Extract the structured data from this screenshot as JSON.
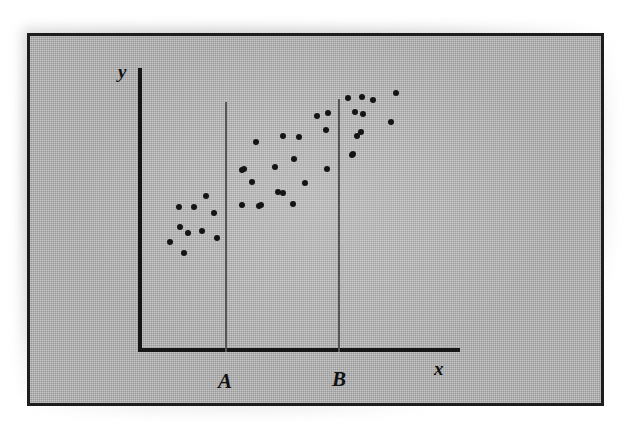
{
  "figure": {
    "kind": "scatter-plot-diagram",
    "frame": {
      "border_color": "#1d1d1d",
      "background_color": "#b3b3b3"
    },
    "axes": {
      "x_label": "x",
      "y_label": "y",
      "axis_color": "#151515"
    },
    "reference_lines": [
      {
        "name": "A",
        "label": "A",
        "x_value": 30,
        "color": "#555555"
      },
      {
        "name": "B",
        "label": "B",
        "x_value": 69,
        "color": "#555555"
      }
    ],
    "dot_color": "#141414"
  },
  "chart_data": {
    "type": "scatter",
    "title": "",
    "xlabel": "x",
    "ylabel": "y",
    "xlim": [
      0,
      100
    ],
    "ylim": [
      0,
      100
    ],
    "grid": false,
    "legend": null,
    "annotations": [
      {
        "text": "A",
        "type": "vertical-reference-line",
        "x": 30
      },
      {
        "text": "B",
        "type": "vertical-reference-line",
        "x": 69
      }
    ],
    "series": [
      {
        "name": "observations",
        "marker": "circle",
        "color": "#141414",
        "points": [
          [
            14,
            48
          ],
          [
            19,
            41
          ],
          [
            22,
            58
          ],
          [
            22,
            57
          ],
          [
            14,
            34
          ],
          [
            20,
            30
          ],
          [
            25,
            51
          ],
          [
            27,
            40
          ],
          [
            17,
            23
          ],
          [
            21,
            18
          ],
          [
            36,
            41
          ],
          [
            40,
            55
          ],
          [
            37,
            33
          ],
          [
            43,
            30
          ],
          [
            46,
            63
          ],
          [
            48,
            48
          ],
          [
            44,
            44
          ],
          [
            52,
            47
          ],
          [
            52,
            68
          ],
          [
            57,
            68
          ],
          [
            56,
            54
          ],
          [
            60,
            41
          ],
          [
            51,
            30
          ],
          [
            46,
            30
          ],
          [
            38,
            30
          ],
          [
            64,
            50
          ],
          [
            66,
            78
          ],
          [
            68,
            62
          ],
          [
            72,
            86
          ],
          [
            75,
            86
          ],
          [
            79,
            85
          ],
          [
            86,
            88
          ],
          [
            74,
            77
          ],
          [
            77,
            76
          ],
          [
            76,
            66
          ],
          [
            75,
            63
          ],
          [
            74,
            51
          ],
          [
            85,
            72
          ],
          [
            88,
            74
          ],
          [
            80,
            41
          ]
        ]
      }
    ]
  },
  "rendered_dots": [
    {
      "x": 170,
      "y": 242
    },
    {
      "x": 179,
      "y": 207
    },
    {
      "x": 180,
      "y": 227
    },
    {
      "x": 184,
      "y": 253
    },
    {
      "x": 188,
      "y": 233
    },
    {
      "x": 194,
      "y": 207
    },
    {
      "x": 202,
      "y": 231
    },
    {
      "x": 206,
      "y": 196
    },
    {
      "x": 214,
      "y": 213
    },
    {
      "x": 217,
      "y": 238
    },
    {
      "x": 242,
      "y": 170
    },
    {
      "x": 242,
      "y": 205
    },
    {
      "x": 244,
      "y": 169
    },
    {
      "x": 252,
      "y": 182
    },
    {
      "x": 256,
      "y": 142
    },
    {
      "x": 259,
      "y": 206
    },
    {
      "x": 261,
      "y": 205
    },
    {
      "x": 275,
      "y": 167
    },
    {
      "x": 278,
      "y": 192
    },
    {
      "x": 283,
      "y": 136
    },
    {
      "x": 293,
      "y": 204
    },
    {
      "x": 294,
      "y": 159
    },
    {
      "x": 299,
      "y": 137
    },
    {
      "x": 305,
      "y": 183
    },
    {
      "x": 317,
      "y": 116
    },
    {
      "x": 326,
      "y": 130
    },
    {
      "x": 327,
      "y": 169
    },
    {
      "x": 328,
      "y": 113
    },
    {
      "x": 348,
      "y": 98
    },
    {
      "x": 352,
      "y": 155
    },
    {
      "x": 353,
      "y": 154
    },
    {
      "x": 355,
      "y": 112
    },
    {
      "x": 357,
      "y": 136
    },
    {
      "x": 361,
      "y": 132
    },
    {
      "x": 362,
      "y": 97
    },
    {
      "x": 363,
      "y": 114
    },
    {
      "x": 373,
      "y": 100
    },
    {
      "x": 391,
      "y": 122
    },
    {
      "x": 396,
      "y": 93
    },
    {
      "x": 283,
      "y": 193
    }
  ]
}
